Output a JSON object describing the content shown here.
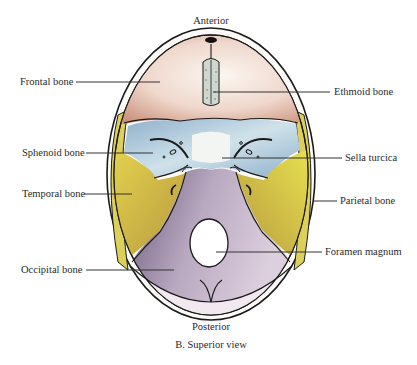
{
  "figure": {
    "orientation_top": "Anterior",
    "orientation_bottom": "Posterior",
    "caption": "B. Superior view"
  },
  "labels": {
    "left": [
      {
        "id": "frontal",
        "text": "Frontal bone"
      },
      {
        "id": "sphenoid",
        "text": "Sphenoid bone"
      },
      {
        "id": "temporal",
        "text": "Temporal bone"
      },
      {
        "id": "occipital",
        "text": "Occipital bone"
      }
    ],
    "right": [
      {
        "id": "ethmoid",
        "text": "Ethmoid bone"
      },
      {
        "id": "sella",
        "text": "Sella turcica"
      },
      {
        "id": "parietal",
        "text": "Parietal bone"
      },
      {
        "id": "foramen",
        "text": "Foramen magnum"
      }
    ]
  },
  "colors": {
    "frontal": "#e8c9bb",
    "sphenoid": "#a9c3d6",
    "temporal": "#d9cf5a",
    "parietal": "#dccf6a",
    "occipital": "#b7a6bd",
    "outline": "#1a1a1a",
    "leader": "#333333"
  }
}
